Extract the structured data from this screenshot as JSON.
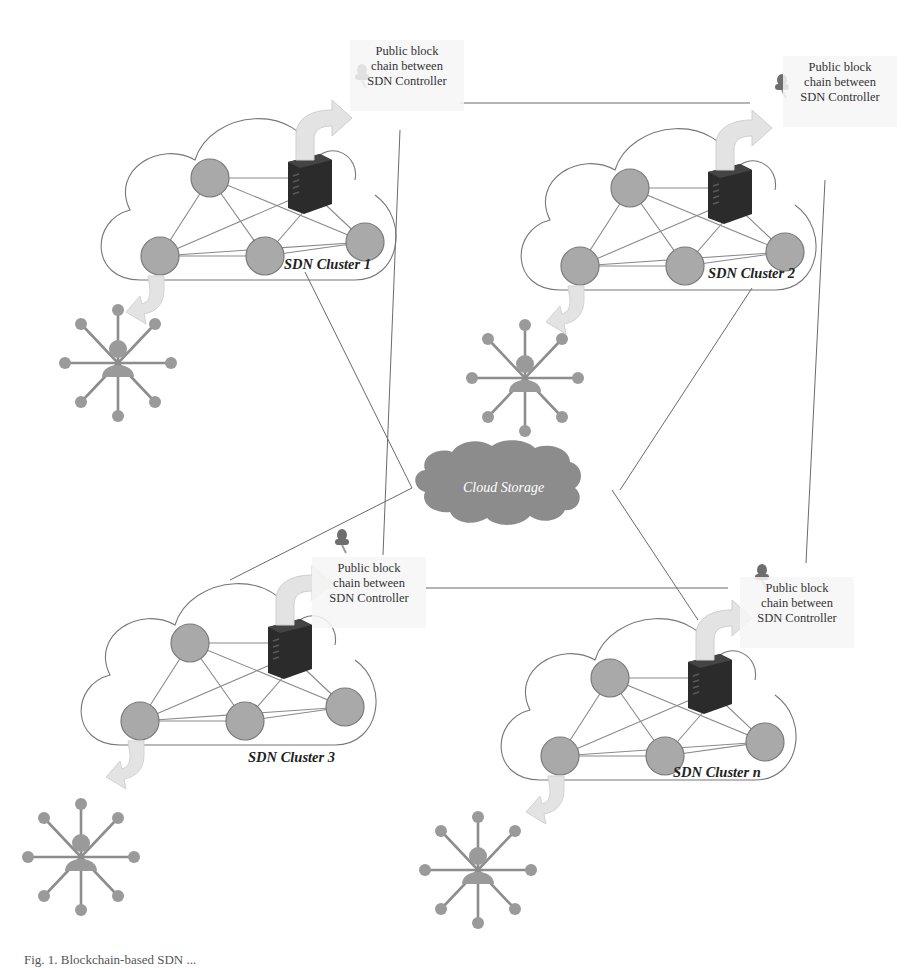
{
  "figure": {
    "caption": "Fig. 1. Blockchain-based SDN ...",
    "cloud_storage_label": "Cloud Storage",
    "blockchain_label_lines": [
      "Public block",
      "chain between",
      "SDN Controller"
    ],
    "clusters": [
      {
        "id": 1,
        "label": "SDN Cluster 1"
      },
      {
        "id": 2,
        "label": "SDN Cluster 2"
      },
      {
        "id": 3,
        "label": "SDN Cluster 3"
      },
      {
        "id": "n",
        "label": "SDN Cluster n"
      }
    ],
    "colors": {
      "node_fill": "#a9a9a9",
      "node_stroke": "#7a7a7a",
      "server": "#2b2b2b",
      "cloud_storage": "#8c8c8c",
      "arrow": "#e3e3e3",
      "line": "#6a6a6a",
      "pin": "#6e6e6e"
    },
    "icons": [
      "server-icon",
      "pushpin-icon",
      "curved-arrow-icon",
      "user-star-network-icon",
      "cloud-icon"
    ]
  }
}
